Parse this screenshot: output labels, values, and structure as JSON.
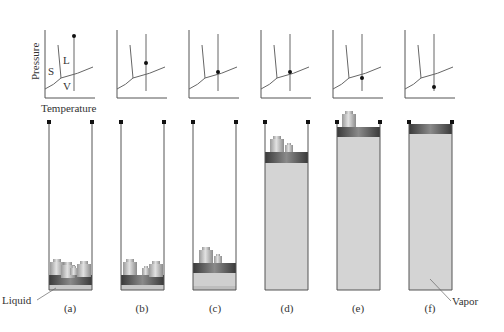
{
  "figure": {
    "axis_labels": {
      "y": "Pressure",
      "x": "Temperature"
    },
    "region_labels": {
      "solid": "S",
      "liquid": "L",
      "vapor": "V"
    },
    "callouts": {
      "liquid": "Liquid",
      "vapor": "Vapor"
    },
    "panels": [
      {
        "id": "a",
        "label": "(a)",
        "state_point": "high pressure (liquid)",
        "piston": "bottom",
        "weights": 4
      },
      {
        "id": "b",
        "label": "(b)",
        "state_point": "on L-V line",
        "piston": "bottom",
        "weights": 3
      },
      {
        "id": "c",
        "label": "(c)",
        "state_point": "on L-V line",
        "piston": "low",
        "weights": 2
      },
      {
        "id": "d",
        "label": "(d)",
        "state_point": "on L-V line",
        "piston": "high",
        "weights": 2
      },
      {
        "id": "e",
        "label": "(e)",
        "state_point": "below L-V line (vapor)",
        "piston": "top",
        "weights": 1
      },
      {
        "id": "f",
        "label": "(f)",
        "state_point": "low pressure (vapor)",
        "piston": "top-stops",
        "weights": 0
      }
    ],
    "colors": {
      "ink": "#333333",
      "vapor_fill": "#d4d4d4",
      "liquid_fill": "#c8c8c8",
      "piston_dark": "#555555",
      "weight": "#b8b8b8"
    }
  }
}
